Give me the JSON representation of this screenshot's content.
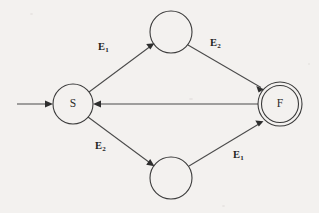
{
  "diagram": {
    "background_color": "#f3f1ef",
    "stroke_color": "#3b3b3b",
    "label_color": "#1e1e1e",
    "nodes": [
      {
        "id": "start",
        "label": "",
        "kind": "start-marker",
        "cx": 17,
        "cy": 104
      },
      {
        "id": "S",
        "label": "S",
        "kind": "start-state",
        "cx": 73,
        "cy": 104,
        "r": 20
      },
      {
        "id": "T",
        "label": "",
        "kind": "state",
        "cx": 171,
        "cy": 32,
        "r": 21
      },
      {
        "id": "B",
        "label": "",
        "kind": "state",
        "cx": 171,
        "cy": 178,
        "r": 21
      },
      {
        "id": "F",
        "label": "F",
        "kind": "accepting-state",
        "cx": 280,
        "cy": 104,
        "r": 22,
        "inner_r": 18.5
      }
    ],
    "edges": [
      {
        "id": "e-start-S",
        "from": "start",
        "to": "S",
        "label": "",
        "sub": ""
      },
      {
        "id": "e-S-T",
        "from": "S",
        "to": "T",
        "label": "E",
        "sub": "1"
      },
      {
        "id": "e-T-F",
        "from": "T",
        "to": "F",
        "label": "E",
        "sub": "2"
      },
      {
        "id": "e-S-B",
        "from": "S",
        "to": "B",
        "label": "E",
        "sub": "2"
      },
      {
        "id": "e-B-F",
        "from": "B",
        "to": "F",
        "label": "E",
        "sub": "1"
      },
      {
        "id": "e-F-S",
        "from": "F",
        "to": "S",
        "label": "",
        "sub": ""
      }
    ],
    "labels": {
      "s_node": "S",
      "f_node": "F",
      "top_left": "E",
      "top_left_sub": "1",
      "top_right": "E",
      "top_right_sub": "2",
      "bottom_left": "E",
      "bottom_left_sub": "2",
      "bottom_right": "E",
      "bottom_right_sub": "1"
    }
  }
}
